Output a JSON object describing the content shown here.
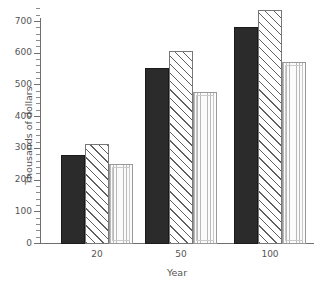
{
  "chart_data": {
    "type": "bar",
    "title": "",
    "xlabel": "Year",
    "ylabel": "Thousands of dollars",
    "categories": [
      "20",
      "50",
      "100"
    ],
    "series": [
      {
        "name": "series-1",
        "style": "solid",
        "values": [
          280,
          553,
          682
        ]
      },
      {
        "name": "series-2",
        "style": "hatch",
        "values": [
          315,
          608,
          735
        ]
      },
      {
        "name": "series-3",
        "style": "stipple",
        "values": [
          250,
          477,
          572
        ]
      }
    ],
    "ylim": [
      0,
      750
    ],
    "y_tick_labels": [
      "0",
      "100",
      "200",
      "300",
      "400",
      "500",
      "600",
      "700"
    ],
    "y_tick_values": [
      0,
      100,
      200,
      300,
      400,
      500,
      600,
      700
    ],
    "y_minor_tick_interval": 20,
    "grid": false,
    "legend": "none",
    "axis_color": "#6f6f6f",
    "text_color": "#555555",
    "colors": {
      "series_1_fill": "#2b2b2b",
      "series_2_fill": "#ffffff",
      "series_2_hatch": "#5f5f5f",
      "series_3_fill": "#fbfbfb",
      "series_3_hatch": "#b9b9b9"
    }
  }
}
